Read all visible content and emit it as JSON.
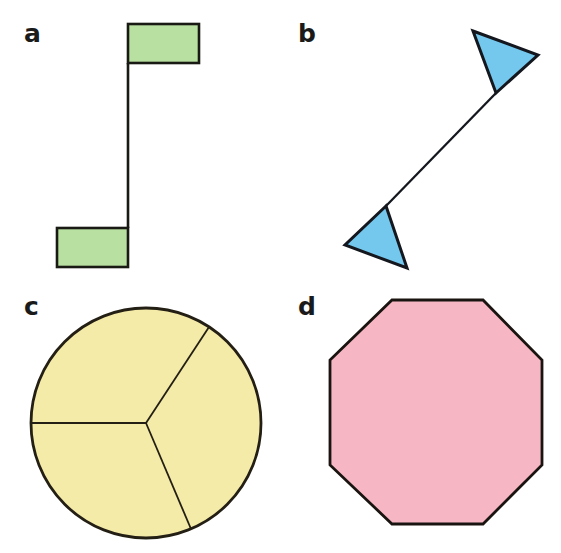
{
  "figure": {
    "width": 561,
    "height": 553,
    "background": "#ffffff",
    "outline_color": "#1a1a14"
  },
  "panels": [
    {
      "id": "a",
      "label": "a",
      "label_x": 24,
      "label_y": 42,
      "shape_name": "z-shaped-step-figure",
      "fill": "#b8e0a0",
      "stroke": "#1a1a14",
      "stroke_width": 2.6,
      "parts": {
        "top_rectangle": {
          "x": 128,
          "y": 24,
          "width": 71,
          "height": 39
        },
        "bottom_rectangle": {
          "x": 57,
          "y": 228,
          "width": 71,
          "height": 39
        },
        "connector_line": {
          "x1": 128,
          "y1": 63,
          "x2": 128,
          "y2": 228
        }
      }
    },
    {
      "id": "b",
      "label": "b",
      "label_x": 298,
      "label_y": 42,
      "shape_name": "twin-triangle-bowtie-figure",
      "fill": "#74c8ee",
      "stroke": "#14181e",
      "stroke_width": 3.0,
      "parts": {
        "upper_triangle": "473,31 538,55 496,93",
        "lower_triangle": "386,206 345,245 407,268",
        "connector_line": {
          "x1": 496,
          "y1": 93,
          "x2": 386,
          "y2": 206
        }
      }
    },
    {
      "id": "c",
      "label": "c",
      "label_x": 24,
      "label_y": 315,
      "shape_name": "circle-with-three-sectors",
      "fill": "#f5eba8",
      "stroke": "#241f14",
      "stroke_width": 2.8,
      "parts": {
        "circle": {
          "cx": 146,
          "cy": 423,
          "r": 115
        },
        "spoke_angles_deg": [
          180,
          57,
          -67
        ],
        "spokes": [
          {
            "x1": 146,
            "y1": 423,
            "x2": 31,
            "y2": 423
          },
          {
            "x1": 146,
            "y1": 423,
            "x2": 209,
            "y2": 327
          },
          {
            "x1": 146,
            "y1": 423,
            "x2": 191,
            "y2": 529
          }
        ]
      }
    },
    {
      "id": "d",
      "label": "d",
      "label_x": 298,
      "label_y": 315,
      "shape_name": "regular-octagon",
      "fill": "#f7b6c4",
      "stroke": "#1a1410",
      "stroke_width": 2.8,
      "parts": {
        "octagon_points": "392,300 483,300 542,360 542,465 483,524 392,524 330,465 330,360",
        "sides": 8
      }
    }
  ],
  "colors": {
    "green_fill": "#b8e0a0",
    "blue_fill": "#74c8ee",
    "yellow_fill": "#f5eba8",
    "pink_fill": "#f7b6c4",
    "outline": "#1a1a14",
    "label_text": "#1a1a1a",
    "background": "#ffffff"
  }
}
